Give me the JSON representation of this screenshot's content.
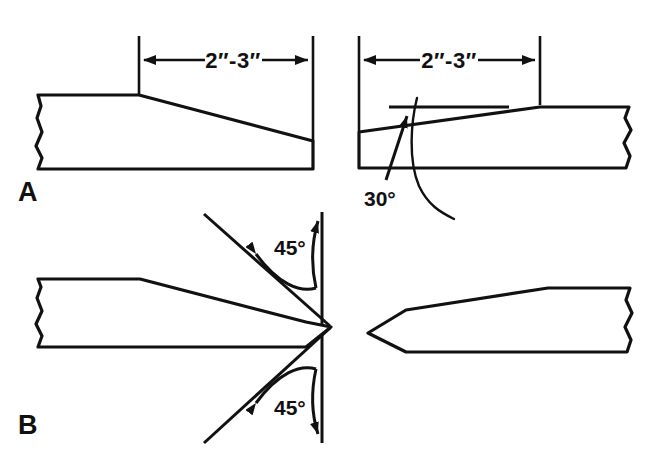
{
  "figure": {
    "background_color": "#ffffff",
    "line_color": "#111111",
    "width": 667,
    "height": 462
  },
  "panels": [
    {
      "label": "A",
      "description": "Single bevel taper on stake end",
      "views": [
        {
          "name": "left-view",
          "dimension_label": "2″-3″"
        },
        {
          "name": "right-view",
          "dimension_label": "2″-3″",
          "angle_label": "30°"
        }
      ]
    },
    {
      "label": "B",
      "description": "Double bevel point on stake end",
      "views": [
        {
          "name": "left-view",
          "angle_label_top": "45°",
          "angle_label_bottom": "45°"
        },
        {
          "name": "right-view"
        }
      ]
    }
  ],
  "labels": {
    "panel_a": "A",
    "panel_b": "B",
    "dim_a_left": "2″-3″",
    "dim_a_right": "2″-3″",
    "angle_30": "30°",
    "angle_45_top": "45°",
    "angle_45_bottom": "45°"
  }
}
